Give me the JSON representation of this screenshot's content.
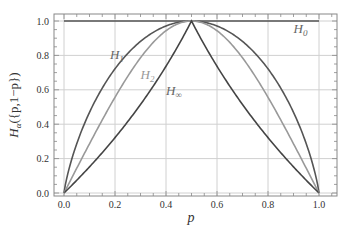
{
  "chart_data": {
    "type": "line",
    "title": "",
    "xlabel": "p",
    "ylabel": "H_α({p,1−p})",
    "xlim": [
      -0.04,
      1.04
    ],
    "ylim": [
      0.0,
      1.04
    ],
    "grid": true,
    "legend": "none (inline annotations)",
    "x_ticks": [
      "0.0",
      "0.2",
      "0.4",
      "0.6",
      "0.8",
      "1.0"
    ],
    "y_ticks": [
      "0.0",
      "0.2",
      "0.4",
      "0.6",
      "0.8",
      "1.0"
    ],
    "x": [
      0.0,
      0.1,
      0.2,
      0.3,
      0.4,
      0.5,
      0.6,
      0.7,
      0.8,
      0.9,
      1.0
    ],
    "series": [
      {
        "name": "H0",
        "label": "H",
        "sub": "0",
        "color": "#555555",
        "values": [
          1.0,
          1.0,
          1.0,
          1.0,
          1.0,
          1.0,
          1.0,
          1.0,
          1.0,
          1.0,
          1.0
        ]
      },
      {
        "name": "H1",
        "label": "H",
        "sub": "1",
        "color": "#555555",
        "values": [
          0.0,
          0.469,
          0.722,
          0.881,
          0.971,
          1.0,
          0.971,
          0.881,
          0.722,
          0.469,
          0.0
        ]
      },
      {
        "name": "H2",
        "label": "H",
        "sub": "2",
        "color": "#999999",
        "values": [
          0.0,
          0.286,
          0.515,
          0.737,
          0.943,
          1.0,
          0.943,
          0.737,
          0.515,
          0.286,
          0.0
        ]
      },
      {
        "name": "H∞",
        "label": "H",
        "sub": "∞",
        "color": "#444444",
        "values": [
          0.0,
          0.152,
          0.322,
          0.515,
          0.737,
          1.0,
          0.737,
          0.515,
          0.322,
          0.152,
          0.0
        ]
      }
    ],
    "annotations": [
      {
        "text": "H",
        "sub": "1",
        "x": 0.18,
        "y": 0.78
      },
      {
        "text": "H",
        "sub": "2",
        "x": 0.3,
        "y": 0.66
      },
      {
        "text": "H",
        "sub": "∞",
        "x": 0.4,
        "y": 0.57
      },
      {
        "text": "H",
        "sub": "0",
        "x": 0.9,
        "y": 0.93
      }
    ]
  }
}
